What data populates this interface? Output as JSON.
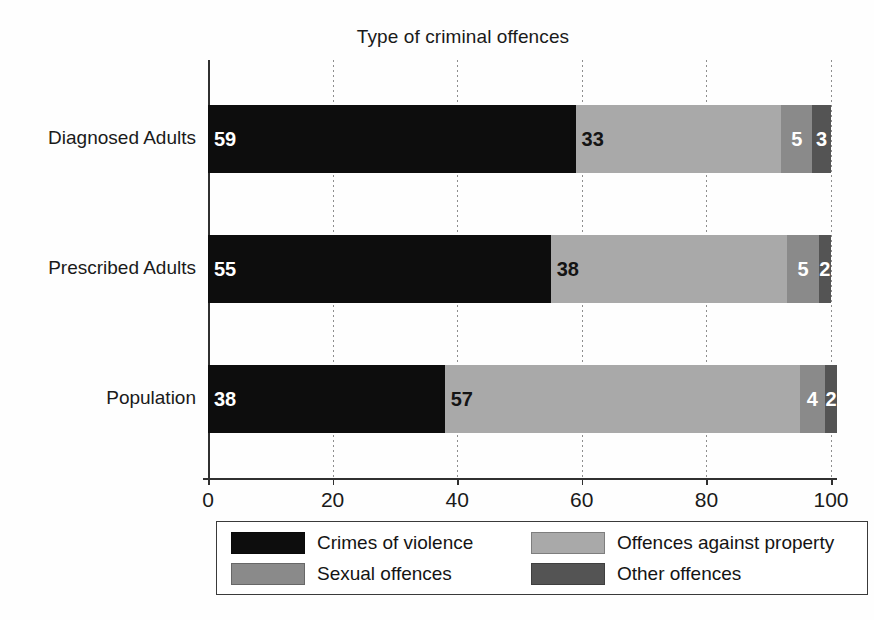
{
  "chart_data": {
    "type": "bar",
    "orientation": "horizontal",
    "stacked": true,
    "stacked_mode": "percent",
    "title": "Type of criminal offences",
    "xlabel": "",
    "ylabel": "",
    "xlim": [
      0,
      100
    ],
    "xticks": [
      0,
      20,
      40,
      60,
      80,
      100
    ],
    "xtick_labels": [
      "0",
      "20",
      "40",
      "60",
      "80",
      "100"
    ],
    "grid": "vertical-dotted",
    "legend_position": "bottom",
    "categories": [
      "Diagnosed Adults",
      "Prescribed Adults",
      "Population"
    ],
    "series": [
      {
        "name": "Crimes of violence",
        "color": "#0d0d0d",
        "label_color": "light",
        "values": [
          59,
          55,
          38
        ]
      },
      {
        "name": "Offences against property",
        "color": "#a9a9a9",
        "label_color": "dark",
        "values": [
          33,
          38,
          57
        ]
      },
      {
        "name": "Sexual offences",
        "color": "#8a8a8a",
        "label_color": "light",
        "values": [
          5,
          5,
          4
        ]
      },
      {
        "name": "Other offences",
        "color": "#545454",
        "label_color": "light",
        "values": [
          3,
          2,
          2
        ]
      }
    ],
    "stack_order": [
      "Crimes of violence",
      "Offences against property",
      "Sexual offences",
      "Other offences"
    ],
    "legend_order": [
      "Crimes of violence",
      "Offences against property",
      "Sexual offences",
      "Other offences"
    ],
    "legend_entries": [
      {
        "label": "Crimes of violence",
        "color": "#0d0d0d"
      },
      {
        "label": "Offences against property",
        "color": "#a9a9a9"
      },
      {
        "label": "Sexual offences",
        "color": "#8a8a8a"
      },
      {
        "label": "Other offences",
        "color": "#545454"
      }
    ],
    "data_labels": [
      {
        "category": "Diagnosed Adults",
        "values": [
          "59",
          "33",
          "5",
          "3"
        ]
      },
      {
        "category": "Prescribed Adults",
        "values": [
          "55",
          "38",
          "5",
          "2"
        ]
      },
      {
        "category": "Population",
        "values": [
          "38",
          "57",
          "4",
          "2"
        ]
      }
    ]
  }
}
